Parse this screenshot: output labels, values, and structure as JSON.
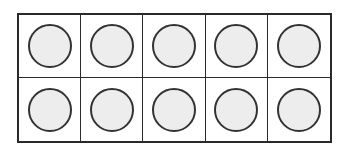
{
  "diagram": {
    "type": "ten-frame",
    "rows": 2,
    "columns": 5,
    "counters_shown": 10,
    "cells": [
      {
        "row": 1,
        "col": 1,
        "filled": true
      },
      {
        "row": 1,
        "col": 2,
        "filled": true
      },
      {
        "row": 1,
        "col": 3,
        "filled": true
      },
      {
        "row": 1,
        "col": 4,
        "filled": true
      },
      {
        "row": 1,
        "col": 5,
        "filled": true
      },
      {
        "row": 2,
        "col": 1,
        "filled": true
      },
      {
        "row": 2,
        "col": 2,
        "filled": true
      },
      {
        "row": 2,
        "col": 3,
        "filled": true
      },
      {
        "row": 2,
        "col": 4,
        "filled": true
      },
      {
        "row": 2,
        "col": 5,
        "filled": true
      }
    ],
    "colors": {
      "grid_line": "#2a2a2a",
      "counter_fill": "#ededed",
      "counter_stroke": "#333333",
      "background": "#ffffff"
    }
  }
}
